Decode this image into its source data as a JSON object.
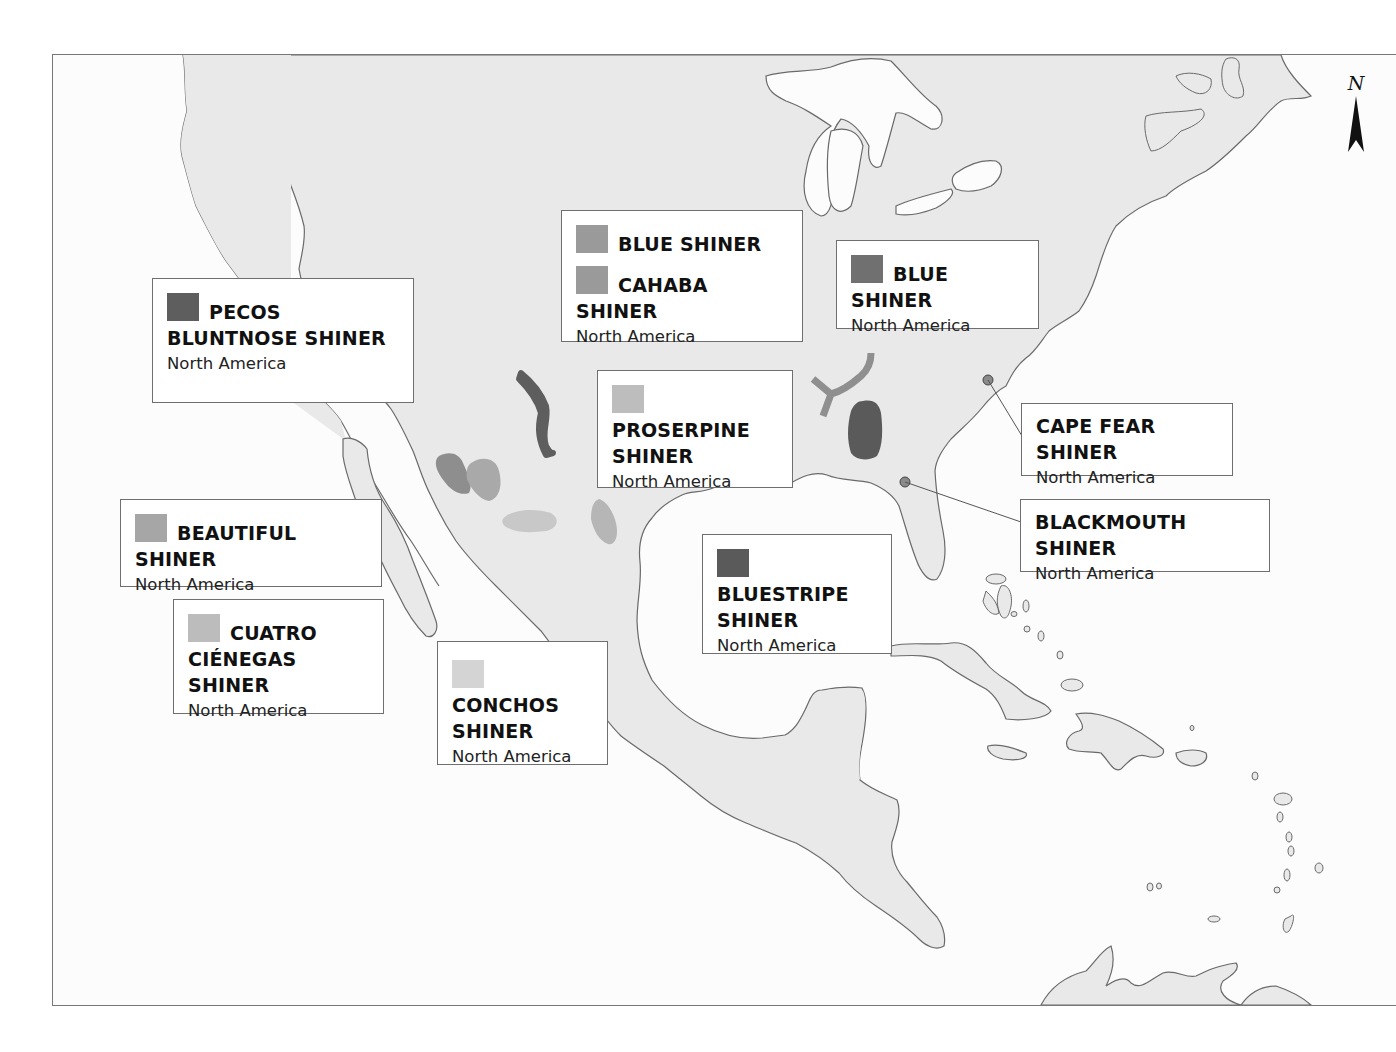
{
  "map": {
    "compass": {
      "letter": "N",
      "icon": "north-arrow-icon"
    },
    "colors": {
      "land": "#e9e9e9",
      "water": "#fcfcfc",
      "coast": "#6a6a6a",
      "dark": "#5e5e5e",
      "medium": "#8c8c8c",
      "light": "#adadad",
      "lighter": "#c4c4c4",
      "palest": "#d0d0d0"
    },
    "labels": [
      {
        "id": "pecos",
        "entries": [
          {
            "name": "PECOS BLUNTNOSE SHINER",
            "swatch": "#5e5e5e"
          }
        ],
        "region": "North America"
      },
      {
        "id": "blue-cahaba",
        "entries": [
          {
            "name": "BLUE SHINER",
            "swatch": "#9a9a9a"
          },
          {
            "name": "CAHABA SHINER",
            "swatch": "#9a9a9a"
          }
        ],
        "region": "North America"
      },
      {
        "id": "blue-east",
        "entries": [
          {
            "name": "BLUE SHINER",
            "swatch": "#707070"
          }
        ],
        "region": "North America"
      },
      {
        "id": "proserpine",
        "entries": [
          {
            "name": "PROSERPINE SHINER",
            "swatch": "#bdbdbd"
          }
        ],
        "region": "North America"
      },
      {
        "id": "capefear",
        "entries": [
          {
            "name": "CAPE FEAR SHINER"
          }
        ],
        "region": "North America"
      },
      {
        "id": "blackmouth",
        "entries": [
          {
            "name": "BLACKMOUTH SHINER"
          }
        ],
        "region": "North America"
      },
      {
        "id": "beautiful",
        "entries": [
          {
            "name": "BEAUTIFUL SHINER",
            "swatch": "#a6a6a6"
          }
        ],
        "region": "North America"
      },
      {
        "id": "cuatro",
        "entries": [
          {
            "name": "CUATRO CIÉNEGAS SHINER",
            "swatch": "#bcbcbc"
          }
        ],
        "region": "North America"
      },
      {
        "id": "conchos",
        "entries": [
          {
            "name": "CONCHOS SHINER",
            "swatch": "#d4d4d4"
          }
        ],
        "region": "North America"
      },
      {
        "id": "bluestripe",
        "entries": [
          {
            "name": "BLUESTRIPE SHINER",
            "swatch": "#5a5a5a"
          }
        ],
        "region": "North America"
      }
    ]
  }
}
